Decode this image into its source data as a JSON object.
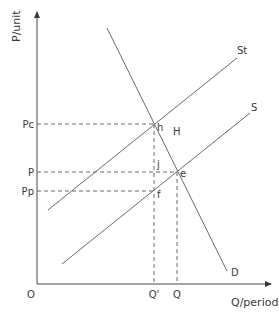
{
  "diagram": {
    "type": "supply-demand-tax",
    "axes": {
      "y_label": "P/unit",
      "x_label": "Q/period",
      "origin_label": "O"
    },
    "price_ticks": [
      {
        "label": "Pc",
        "y": 124
      },
      {
        "label": "P",
        "y": 172
      },
      {
        "label": "Pp",
        "y": 191
      }
    ],
    "quantity_ticks": [
      {
        "label": "Q'",
        "x": 154
      },
      {
        "label": "Q",
        "x": 177
      }
    ],
    "curves": [
      {
        "name": "St",
        "label": "St",
        "from": [
          48,
          210
        ],
        "to": [
          237,
          58
        ]
      },
      {
        "name": "S",
        "label": "S",
        "from": [
          62,
          264
        ],
        "to": [
          250,
          113
        ]
      },
      {
        "name": "D",
        "label": "D",
        "from": [
          107,
          28
        ],
        "to": [
          227,
          271
        ]
      }
    ],
    "points": [
      {
        "label": "h",
        "x": 154,
        "y": 124
      },
      {
        "label": "j",
        "x": 154,
        "y": 172
      },
      {
        "label": "e",
        "x": 177,
        "y": 172
      },
      {
        "label": "f",
        "x": 154,
        "y": 191
      }
    ],
    "region_labels": [
      {
        "label": "H",
        "x": 173,
        "y": 135
      }
    ]
  }
}
